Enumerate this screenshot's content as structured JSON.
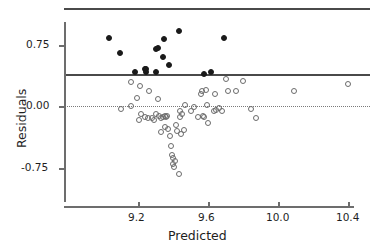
{
  "chart_data": {
    "type": "scatter",
    "title": "",
    "xlabel": "Predicted",
    "ylabel": "Residuals",
    "xlim": [
      9.0,
      10.47
    ],
    "ylim": [
      -1.12,
      1.22
    ],
    "grid": false,
    "legend": null,
    "xticks": [
      9.2,
      9.6,
      10.0,
      10.4
    ],
    "xtick_labels": [
      "9.2",
      "9.6",
      "10.0",
      "10.4"
    ],
    "yticks": [
      0.75,
      0.0,
      -0.75
    ],
    "ytick_labels": [
      "0.75",
      "0.00",
      "-0.75"
    ],
    "reference_lines": [
      {
        "name": "upper-bound-line",
        "y": 1.18,
        "style": "solid",
        "color": "#4a4a4a"
      },
      {
        "name": "threshold-line",
        "y": 0.38,
        "style": "solid",
        "color": "#4a4a4a"
      },
      {
        "name": "zero-line",
        "y": 0.0,
        "style": "dotted",
        "color": "#7a7a7a"
      }
    ],
    "series": [
      {
        "name": "flagged-residuals",
        "marker": "filled-circle",
        "color": "#1a1a1a",
        "points": [
          [
            9.035,
            0.835
          ],
          [
            9.095,
            0.655
          ],
          [
            9.18,
            0.415
          ],
          [
            9.238,
            0.46
          ],
          [
            9.245,
            0.455
          ],
          [
            9.243,
            0.418
          ],
          [
            9.3,
            0.7
          ],
          [
            9.315,
            0.712
          ],
          [
            9.305,
            0.418
          ],
          [
            9.342,
            0.6
          ],
          [
            9.348,
            0.828
          ],
          [
            9.375,
            0.505
          ],
          [
            9.432,
            0.92
          ],
          [
            9.575,
            0.395
          ],
          [
            9.618,
            0.425
          ],
          [
            9.69,
            0.83
          ]
        ]
      },
      {
        "name": "ordinary-residuals",
        "marker": "open-circle",
        "color": "#6b6b6b",
        "points": [
          [
            9.158,
            0.295
          ],
          [
            9.105,
            -0.035
          ],
          [
            9.16,
            0.005
          ],
          [
            9.213,
            0.25
          ],
          [
            9.196,
            0.1
          ],
          [
            9.262,
            0.185
          ],
          [
            9.218,
            -0.095
          ],
          [
            9.205,
            -0.16
          ],
          [
            9.238,
            -0.13
          ],
          [
            9.258,
            -0.14
          ],
          [
            9.278,
            -0.135
          ],
          [
            9.292,
            -0.16
          ],
          [
            9.312,
            0.095
          ],
          [
            9.3,
            -0.09
          ],
          [
            9.318,
            -0.12
          ],
          [
            9.33,
            -0.135
          ],
          [
            9.345,
            -0.125
          ],
          [
            9.352,
            -0.11
          ],
          [
            9.362,
            -0.13
          ],
          [
            9.368,
            -0.115
          ],
          [
            9.33,
            -0.305
          ],
          [
            9.355,
            -0.255
          ],
          [
            9.372,
            -0.27
          ],
          [
            9.382,
            -0.365
          ],
          [
            9.39,
            -0.48
          ],
          [
            9.392,
            -0.59
          ],
          [
            9.398,
            -0.625
          ],
          [
            9.402,
            -0.7
          ],
          [
            9.405,
            -0.742
          ],
          [
            9.412,
            -0.66
          ],
          [
            9.418,
            -0.23
          ],
          [
            9.425,
            -0.3
          ],
          [
            9.432,
            -0.825
          ],
          [
            9.44,
            -0.13
          ],
          [
            9.438,
            -0.055
          ],
          [
            9.452,
            -0.095
          ],
          [
            9.448,
            -0.33
          ],
          [
            9.465,
            -0.29
          ],
          [
            9.468,
            0.02
          ],
          [
            9.505,
            -0.06
          ],
          [
            9.518,
            -0.005
          ],
          [
            9.545,
            -0.13
          ],
          [
            9.558,
            0.155
          ],
          [
            9.568,
            0.195
          ],
          [
            9.572,
            -0.115
          ],
          [
            9.578,
            -0.125
          ],
          [
            9.588,
            0.205
          ],
          [
            9.596,
            0.02
          ],
          [
            9.6,
            -0.2
          ],
          [
            9.632,
            -0.06
          ],
          [
            9.638,
            0.15
          ],
          [
            9.648,
            -0.045
          ],
          [
            9.662,
            -0.015
          ],
          [
            9.682,
            -0.055
          ],
          [
            9.7,
            0.34
          ],
          [
            9.715,
            0.185
          ],
          [
            9.762,
            0.195
          ],
          [
            9.8,
            0.305
          ],
          [
            9.848,
            -0.03
          ],
          [
            9.875,
            -0.14
          ],
          [
            10.09,
            0.195
          ],
          [
            10.4,
            0.27
          ]
        ]
      }
    ]
  },
  "axes": {
    "x_axis_name": "predicted-axis",
    "y_axis_name": "residuals-axis"
  }
}
